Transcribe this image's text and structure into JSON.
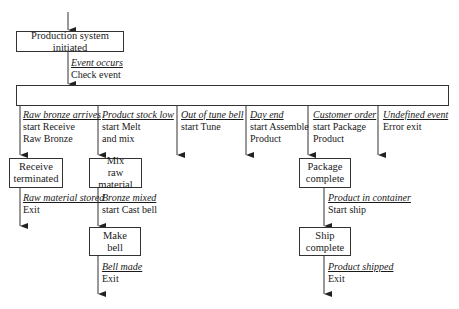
{
  "diagram": {
    "start_state": "Production system initiated",
    "top_transition": {
      "event": "Event occurs",
      "action": "Check event"
    },
    "branches": [
      {
        "event": "Raw bronze arrives",
        "action_lines": [
          "start Receive",
          "Raw Bronze"
        ]
      },
      {
        "event": "Product stock low",
        "action_lines": [
          "start Melt",
          "and mix"
        ]
      },
      {
        "event": "Out of tune bell",
        "action_lines": [
          "start Tune"
        ]
      },
      {
        "event": "Day end",
        "action_lines": [
          "start Assemble",
          "Product"
        ]
      },
      {
        "event": "Customer order",
        "action_lines": [
          "start Package",
          "Product"
        ]
      },
      {
        "event": "Undefined event",
        "action_lines": [
          "Error exit"
        ]
      }
    ],
    "states": {
      "receive": [
        "Receive",
        "terminated"
      ],
      "mix": [
        "Mix",
        "raw material"
      ],
      "make": [
        "Make",
        "bell"
      ],
      "package": [
        "Package",
        "complete"
      ],
      "ship": [
        "Ship",
        "complete"
      ]
    },
    "transitions": {
      "receive_exit": {
        "event": "Raw material stored",
        "action": "Exit"
      },
      "mix_to_make": {
        "event": "Bronze mixed",
        "action": "start Cast bell"
      },
      "make_exit": {
        "event": "Bell made",
        "action": "Exit"
      },
      "package_to_ship": {
        "event": "Product in container",
        "action": "Start ship"
      },
      "ship_exit": {
        "event": "Product shipped",
        "action": "Exit"
      }
    }
  }
}
